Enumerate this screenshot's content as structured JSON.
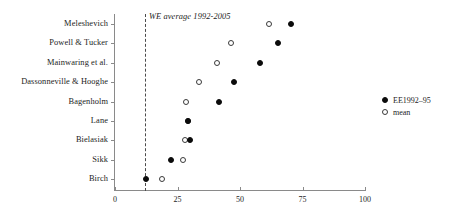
{
  "chart_data": {
    "type": "scatter",
    "title": "",
    "subtitle": "",
    "xlabel": "",
    "ylabel": "",
    "xlim": [
      0,
      100
    ],
    "ylim_categories": true,
    "grid": false,
    "legend_position": "right",
    "orientation": "horizontal-dot-plot",
    "categories": [
      "Meleshevich",
      "Powell & Tucker",
      "Mainwaring et al.",
      "Dassonneville & Hooghe",
      "Bagenholm",
      "Lane",
      "Bielasiak",
      "Sikk",
      "Birch"
    ],
    "xticks": [
      0,
      25,
      50,
      75,
      100
    ],
    "series": [
      {
        "name": "EE1992–95",
        "marker": "filled-circle",
        "color": "#0b0b0b",
        "values": [
          70.3,
          65.2,
          58.0,
          47.6,
          41.5,
          29.3,
          30.0,
          22.3,
          12.2
        ]
      },
      {
        "name": "mean",
        "marker": "open-circle",
        "color": "#3a3a3a",
        "values": [
          61.7,
          46.3,
          40.7,
          33.6,
          28.4,
          29.0,
          27.9,
          27.1,
          18.9
        ]
      }
    ],
    "annotations": [
      {
        "text": "WE average 1992-2005",
        "type": "vertical-reference-line",
        "x": 12.0,
        "style": "dashed",
        "italic": true
      }
    ]
  },
  "legend": {
    "items": [
      {
        "label": "EE1992–95",
        "marker": "filled-circle"
      },
      {
        "label": "mean",
        "marker": "open-circle"
      }
    ]
  },
  "colors": {
    "filled_marker": "#0b0b0b",
    "open_marker": "#3a3a3a",
    "axis": "#8a8a8a",
    "reference_line": "#4a4a4a",
    "text": "#1c1c1c",
    "background": "#ffffff"
  }
}
